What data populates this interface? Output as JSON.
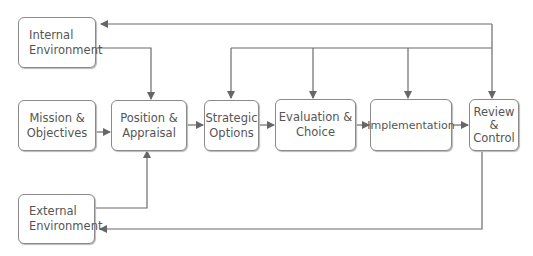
{
  "diagram": {
    "type": "flowchart",
    "nodes": {
      "internal_environment": {
        "line1": "Internal",
        "line2": "Environment"
      },
      "mission_objectives": {
        "line1": "Mission &",
        "line2": "Objectives"
      },
      "position_appraisal": {
        "line1": "Position &",
        "line2": "Appraisal"
      },
      "strategic_options": {
        "line1": "Strategic",
        "line2": "Options"
      },
      "evaluation_choice": {
        "line1": "Evaluation &",
        "line2": "Choice"
      },
      "implementation": {
        "line1": "Implementation"
      },
      "review_control": {
        "line1": "Review",
        "line2": "&",
        "line3": "Control"
      },
      "external_environment": {
        "line1": "External",
        "line2": "Environment"
      }
    },
    "edges": [
      {
        "from": "Internal Environment",
        "to": "Position & Appraisal"
      },
      {
        "from": "External Environment",
        "to": "Position & Appraisal"
      },
      {
        "from": "Mission & Objectives",
        "to": "Position & Appraisal"
      },
      {
        "from": "Position & Appraisal",
        "to": "Strategic Options"
      },
      {
        "from": "Strategic Options",
        "to": "Evaluation & Choice"
      },
      {
        "from": "Evaluation & Choice",
        "to": "Implementation"
      },
      {
        "from": "Implementation",
        "to": "Review & Control"
      },
      {
        "from": "Review & Control (feedback)",
        "to": "Internal Environment"
      },
      {
        "from": "Review & Control (feedback)",
        "to": "Review & Control"
      },
      {
        "from": "Review & Control (feedback)",
        "to": "Strategic Options"
      },
      {
        "from": "Review & Control (feedback)",
        "to": "Evaluation & Choice"
      },
      {
        "from": "Review & Control (feedback)",
        "to": "Implementation"
      },
      {
        "from": "Review & Control",
        "to": "External Environment"
      }
    ],
    "colors": {
      "line": "#6b6b6b",
      "box_border": "#8a8a8a",
      "text": "#555555"
    }
  }
}
